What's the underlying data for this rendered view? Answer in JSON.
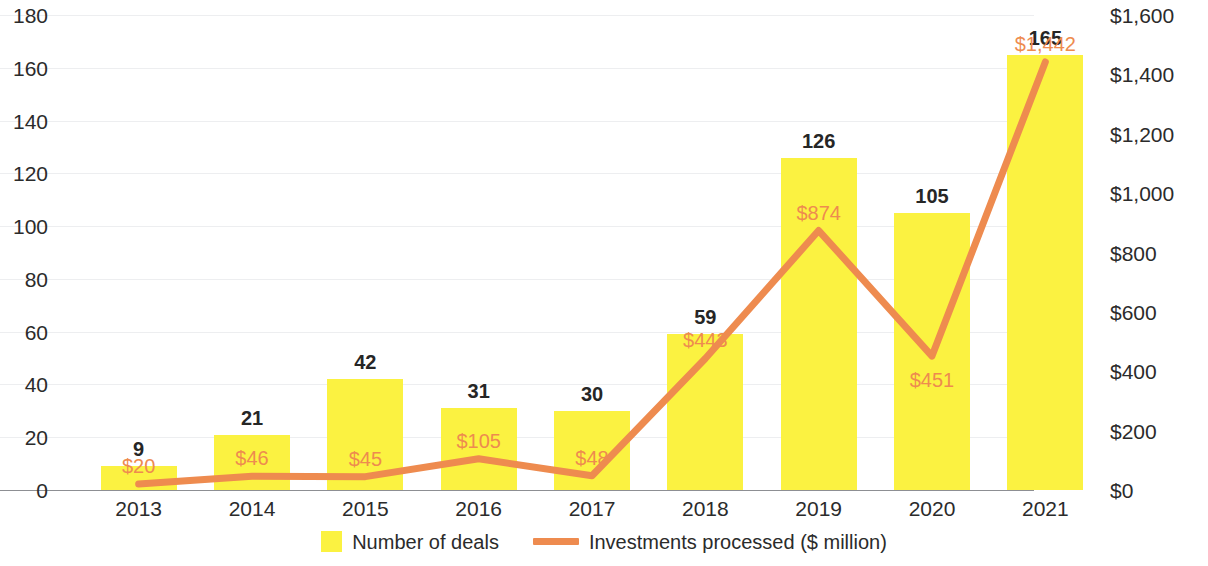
{
  "chart_data": {
    "type": "bar",
    "title": "",
    "subtitle": "",
    "xlabel": "",
    "ylabel": "",
    "categories": [
      "2013",
      "2014",
      "2015",
      "2016",
      "2017",
      "2018",
      "2019",
      "2020",
      "2021"
    ],
    "series": [
      {
        "name": "Number of deals",
        "type": "bar",
        "axis": "left",
        "color": "#FBF241",
        "values": [
          9,
          21,
          42,
          31,
          30,
          59,
          126,
          105,
          165
        ],
        "labels": [
          "9",
          "21",
          "42",
          "31",
          "30",
          "59",
          "126",
          "105",
          "165"
        ]
      },
      {
        "name": "Investments processed ($ million)",
        "type": "line",
        "axis": "right",
        "color": "#EE8B4F",
        "values": [
          20,
          46,
          45,
          105,
          48,
          443,
          874,
          451,
          1442
        ],
        "labels": [
          "$20",
          "$46",
          "$45",
          "$105",
          "$48",
          "$443",
          "$874",
          "$451",
          "$1,442"
        ]
      }
    ],
    "left_axis": {
      "ticks": [
        "0",
        "20",
        "40",
        "60",
        "80",
        "100",
        "120",
        "140",
        "160",
        "180"
      ],
      "min": 0,
      "max": 180
    },
    "right_axis": {
      "ticks": [
        "$0",
        "$200",
        "$400",
        "$600",
        "$800",
        "$1,000",
        "$1,200",
        "$1,400",
        "$1,600"
      ],
      "min": 0,
      "max": 1600
    },
    "grid": true,
    "legend_position": "bottom",
    "legend": [
      {
        "label": "Number of deals",
        "marker": "square",
        "color": "#FBF241"
      },
      {
        "label": "Investments processed ($ million)",
        "marker": "line",
        "color": "#EE8B4F"
      }
    ]
  }
}
